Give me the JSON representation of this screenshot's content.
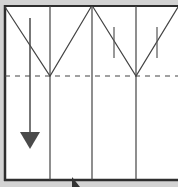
{
  "diagram": {
    "title": "",
    "colors": {
      "background": "#d3d3d3",
      "paper": "#ffffff",
      "line": "#3a3a3a",
      "arrow": "#4a4a4a"
    },
    "panels": 4,
    "fold_line": "dashed horizontal",
    "arrow_direction": "down",
    "cursor": "arrow-cursor"
  }
}
